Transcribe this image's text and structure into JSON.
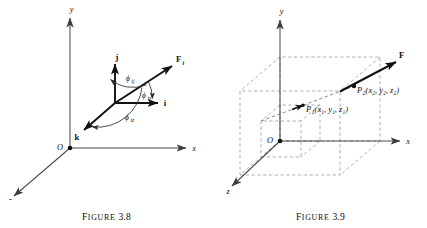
{
  "figures": [
    {
      "id": "figure-3-8",
      "caption_word": "Figure",
      "caption_number": "3.8",
      "axes": {
        "x_label": "x",
        "y_label": "y",
        "z_label": "z",
        "origin_label": "O"
      },
      "vectors": [
        {
          "name": "i-unit-vector",
          "label": "i",
          "subscript": ""
        },
        {
          "name": "j-unit-vector",
          "label": "j",
          "subscript": ""
        },
        {
          "name": "k-unit-vector",
          "label": "k",
          "subscript": ""
        },
        {
          "name": "force-vector",
          "label": "F",
          "subscript": "i"
        }
      ],
      "angles": [
        {
          "name": "angle-phi-ij",
          "symbol": "ϕ",
          "subscript": "ij"
        },
        {
          "name": "angle-phi-ix",
          "symbol": "ϕ",
          "subscript": "ix"
        },
        {
          "name": "angle-phi-iz",
          "symbol": "ϕ",
          "subscript": "iz"
        }
      ]
    },
    {
      "id": "figure-3-9",
      "caption_word": "Figure",
      "caption_number": "3.9",
      "axes": {
        "x_label": "x",
        "y_label": "y",
        "z_label": "z",
        "origin_label": "O"
      },
      "vectors": [
        {
          "name": "force-vector",
          "label": "F",
          "subscript": ""
        }
      ],
      "points": [
        {
          "name": "point-p1",
          "label": "P",
          "index": "1",
          "coords": "(x₁, y₁, z₁)",
          "coord_text": "(x1, y1, z1)"
        },
        {
          "name": "point-p2",
          "label": "P",
          "index": "2",
          "coords": "(x₂, y₂, z₂)",
          "coord_text": "(x2, y2, z2)"
        }
      ]
    }
  ],
  "colors": {
    "ink": "#0d0d0d",
    "axis": "#4a4a4a",
    "dashed": "#8a8a8a",
    "background": "#ffffff"
  }
}
